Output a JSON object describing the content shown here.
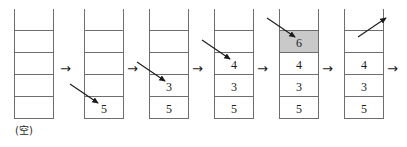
{
  "diagram": {
    "cell_width": 40,
    "cell_height": 22,
    "stack_capacity": 5,
    "colors": {
      "stroke": "#6e6e6e",
      "text": "#1a1a1a",
      "highlight_fill": "#c9c9c9",
      "arrow": "#1a1a1a",
      "background": "#ffffff"
    },
    "empty_caption": "(空)",
    "separator_arrow": "→",
    "stacks": [
      {
        "name": "stack-step-1",
        "x": 14,
        "y": 9,
        "cells": [
          "",
          "",
          "",
          "",
          ""
        ],
        "highlight_index": null,
        "caption": "(空)",
        "in_arrow": null,
        "out_arrow": null
      },
      {
        "name": "stack-step-2",
        "x": 84,
        "y": 9,
        "cells": [
          "",
          "",
          "",
          "",
          "5"
        ],
        "highlight_index": null,
        "caption": "",
        "in_arrow": {
          "x1": 70,
          "y1": 84,
          "x2": 98,
          "y2": 103
        },
        "out_arrow": null
      },
      {
        "name": "stack-step-3",
        "x": 149,
        "y": 9,
        "cells": [
          "",
          "",
          "",
          "3",
          "5"
        ],
        "highlight_index": null,
        "caption": "",
        "in_arrow": {
          "x1": 137,
          "y1": 62,
          "x2": 165,
          "y2": 81
        },
        "out_arrow": null
      },
      {
        "name": "stack-step-4",
        "x": 214,
        "y": 9,
        "cells": [
          "",
          "",
          "4",
          "3",
          "5"
        ],
        "highlight_index": null,
        "caption": "",
        "in_arrow": {
          "x1": 202,
          "y1": 40,
          "x2": 230,
          "y2": 59
        },
        "out_arrow": null
      },
      {
        "name": "stack-step-5",
        "x": 279,
        "y": 9,
        "cells": [
          "",
          "6",
          "4",
          "3",
          "5"
        ],
        "highlight_index": 1,
        "caption": "",
        "in_arrow": {
          "x1": 267,
          "y1": 18,
          "x2": 295,
          "y2": 37
        },
        "out_arrow": null
      },
      {
        "name": "stack-step-6",
        "x": 344,
        "y": 9,
        "cells": [
          "",
          "",
          "4",
          "3",
          "5"
        ],
        "highlight_index": null,
        "caption": "",
        "in_arrow": null,
        "out_arrow": {
          "x1": 358,
          "y1": 37,
          "x2": 386,
          "y2": 18
        }
      }
    ],
    "separators": [
      {
        "name": "separator-arrow-1",
        "x": 60,
        "y": 62
      },
      {
        "name": "separator-arrow-2",
        "x": 127,
        "y": 62
      },
      {
        "name": "separator-arrow-3",
        "x": 192,
        "y": 62
      },
      {
        "name": "separator-arrow-4",
        "x": 257,
        "y": 62
      },
      {
        "name": "separator-arrow-5",
        "x": 322,
        "y": 62
      },
      {
        "name": "separator-arrow-6",
        "x": 387,
        "y": 62
      }
    ]
  }
}
